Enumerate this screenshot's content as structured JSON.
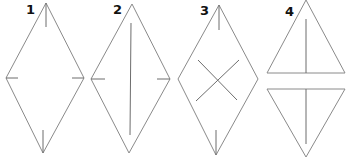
{
  "diagram": {
    "type": "folding-steps",
    "stroke_color": "#8a8a8a",
    "steps": [
      {
        "label": "1",
        "shape": "kite",
        "marks": [
          "top-crease-tick",
          "bottom-crease-tick",
          "left-crease-tick",
          "right-crease-tick"
        ]
      },
      {
        "label": "2",
        "shape": "kite",
        "marks": [
          "vertical-fold-line",
          "left-crease-tick",
          "right-crease-tick"
        ]
      },
      {
        "label": "3",
        "shape": "kite",
        "marks": [
          "top-crease-tick",
          "bottom-crease-tick",
          "diagonal-cross-folds"
        ]
      },
      {
        "label": "4",
        "shape": "kite-split-into-two-triangles",
        "marks": [
          "upper-triangle-center-line",
          "lower-triangle-center-line"
        ]
      }
    ]
  }
}
